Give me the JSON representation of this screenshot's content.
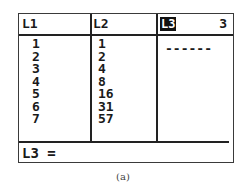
{
  "list_editor": {
    "headers": {
      "l1": "L1",
      "l2": "L2",
      "l3": "L3",
      "l3_column_index": "3"
    },
    "columns": {
      "l1": [
        "1",
        "2",
        "3",
        "4",
        "5",
        "6",
        "7"
      ],
      "l2": [
        "1",
        "2",
        "4",
        "8",
        "16",
        "31",
        "57"
      ],
      "l3_placeholder": "------"
    },
    "entry_line": "L3 ="
  },
  "caption": "(a)"
}
